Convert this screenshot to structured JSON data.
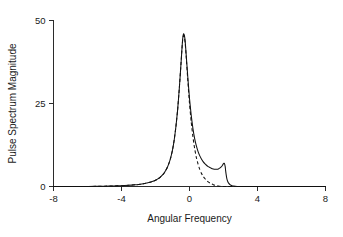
{
  "chart_data": {
    "type": "line",
    "title": "",
    "xlabel": "Angular Frequency",
    "ylabel": "Pulse Spectrum Magnitude",
    "xlim": [
      -8,
      8
    ],
    "ylim": [
      0,
      50
    ],
    "xticks": [
      -8,
      -4,
      0,
      4,
      8
    ],
    "xtick_labels": [
      "-8",
      "-4",
      "0",
      "4",
      "8"
    ],
    "yticks": [
      0,
      25,
      50
    ],
    "ytick_labels": [
      "0",
      "25",
      "50"
    ],
    "grid": false,
    "legend": "none",
    "annotations": [],
    "series": [
      {
        "name": "solid-curve",
        "style": "solid",
        "color": "#111111",
        "comment": "Main resonance peak near -0.4 reaching ~46, with shoulder decay and a sharp secondary peak near 2.1 reaching ~7",
        "x": [
          -8.0,
          -7.0,
          -6.0,
          -5.5,
          -5.0,
          -4.5,
          -4.0,
          -3.6,
          -3.2,
          -3.0,
          -2.8,
          -2.6,
          -2.4,
          -2.2,
          -2.0,
          -1.9,
          -1.8,
          -1.7,
          -1.6,
          -1.5,
          -1.4,
          -1.3,
          -1.2,
          -1.1,
          -1.0,
          -0.9,
          -0.8,
          -0.7,
          -0.6,
          -0.5,
          -0.45,
          -0.4,
          -0.35,
          -0.3,
          -0.25,
          -0.2,
          -0.1,
          0.0,
          0.1,
          0.2,
          0.3,
          0.4,
          0.5,
          0.6,
          0.7,
          0.8,
          0.9,
          1.0,
          1.1,
          1.2,
          1.3,
          1.4,
          1.5,
          1.6,
          1.7,
          1.8,
          1.9,
          1.95,
          2.0,
          2.05,
          2.1,
          2.12,
          2.15,
          2.2,
          2.25,
          2.3,
          2.4,
          2.5,
          2.6,
          2.7,
          2.8,
          3.0,
          3.3,
          3.6,
          4.0,
          4.5,
          5.0,
          6.0,
          7.0,
          8.0
        ],
        "y": [
          0.0,
          0.0,
          0.0,
          0.05,
          0.1,
          0.15,
          0.25,
          0.35,
          0.5,
          0.6,
          0.75,
          0.95,
          1.2,
          1.5,
          1.9,
          2.2,
          2.5,
          2.9,
          3.4,
          4.0,
          4.8,
          5.8,
          7.1,
          8.8,
          11.0,
          14.0,
          18.0,
          23.0,
          29.5,
          37.0,
          41.0,
          44.5,
          46.0,
          45.5,
          43.5,
          40.0,
          33.0,
          26.5,
          21.5,
          17.5,
          14.5,
          12.3,
          10.6,
          9.3,
          8.3,
          7.5,
          6.9,
          6.4,
          6.0,
          5.7,
          5.45,
          5.3,
          5.2,
          5.2,
          5.3,
          5.6,
          6.1,
          6.5,
          6.9,
          7.0,
          6.0,
          5.0,
          3.8,
          2.3,
          1.5,
          1.0,
          0.5,
          0.25,
          0.12,
          0.06,
          0.03,
          0.0,
          0.0,
          0.0,
          0.0,
          0.0,
          0.0,
          0.0,
          0.0,
          0.0
        ]
      },
      {
        "name": "dashed-curve",
        "style": "dashed",
        "color": "#111111",
        "comment": "Overlaps the solid curve on the rising flank and peak, then decays monotonically to zero near 1.8 with no secondary peak",
        "x": [
          -8.0,
          -7.0,
          -6.0,
          -5.5,
          -5.0,
          -4.5,
          -4.0,
          -3.6,
          -3.2,
          -3.0,
          -2.8,
          -2.6,
          -2.4,
          -2.2,
          -2.0,
          -1.9,
          -1.8,
          -1.7,
          -1.6,
          -1.5,
          -1.4,
          -1.3,
          -1.2,
          -1.1,
          -1.0,
          -0.9,
          -0.8,
          -0.7,
          -0.6,
          -0.5,
          -0.45,
          -0.4,
          -0.35,
          -0.3,
          -0.25,
          -0.2,
          -0.1,
          0.0,
          0.1,
          0.2,
          0.3,
          0.4,
          0.5,
          0.6,
          0.7,
          0.8,
          0.9,
          1.0,
          1.1,
          1.2,
          1.3,
          1.4,
          1.5,
          1.6,
          1.7,
          1.8,
          1.9,
          2.0,
          2.2,
          2.5,
          3.0,
          4.0,
          6.0,
          8.0
        ],
        "y": [
          0.0,
          0.0,
          0.0,
          0.05,
          0.1,
          0.15,
          0.25,
          0.35,
          0.5,
          0.6,
          0.75,
          0.95,
          1.2,
          1.5,
          1.9,
          2.2,
          2.5,
          2.9,
          3.4,
          4.0,
          4.8,
          5.8,
          7.1,
          8.8,
          11.0,
          14.0,
          18.0,
          23.0,
          29.5,
          37.0,
          41.0,
          44.2,
          45.5,
          45.0,
          43.0,
          39.5,
          32.0,
          25.0,
          19.5,
          15.0,
          11.5,
          8.8,
          6.8,
          5.2,
          4.0,
          3.1,
          2.4,
          1.85,
          1.4,
          1.05,
          0.78,
          0.56,
          0.39,
          0.26,
          0.15,
          0.07,
          0.02,
          0.0,
          0.0,
          0.0,
          0.0,
          0.0,
          0.0,
          0.0
        ]
      }
    ]
  }
}
